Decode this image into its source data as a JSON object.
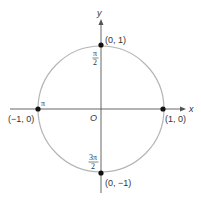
{
  "diagram": {
    "axes": {
      "x_label": "x",
      "y_label": "y",
      "origin_label": "O"
    },
    "points": [
      {
        "id": "right",
        "coord_label": "(1, 0)",
        "angle_label": ""
      },
      {
        "id": "top",
        "coord_label": "(0, 1)",
        "angle_label_num": "π",
        "angle_label_den": "2"
      },
      {
        "id": "left",
        "coord_label": "(−1, 0)",
        "angle_label": "π"
      },
      {
        "id": "bottom",
        "coord_label": "(0, −1)",
        "angle_label_num": "3π",
        "angle_label_den": "2"
      }
    ],
    "colors": {
      "circle": "#b5b5b5",
      "axis": "#555555",
      "point": "#111111",
      "text": "#333333"
    }
  }
}
